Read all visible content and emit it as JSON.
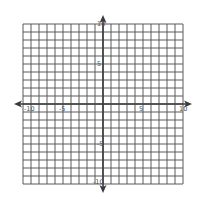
{
  "chart_data": {
    "type": "coordinate-grid",
    "title": "",
    "xlabel": "",
    "ylabel": "",
    "xlim": [
      -10,
      10
    ],
    "ylim": [
      -10,
      10
    ],
    "grid": true,
    "grid_step": 1,
    "x_tick_labels": [
      "-10",
      "-5",
      "5",
      "10"
    ],
    "y_tick_labels": [
      "10",
      "5",
      "-5",
      "-10"
    ],
    "x_tick_values": [
      -10,
      -5,
      5,
      10
    ],
    "y_tick_values": [
      10,
      5,
      -5,
      -10
    ],
    "axis_arrows": true,
    "series": []
  },
  "colors": {
    "grid_line": "#5a5a5a",
    "axis_line": "#3a3a3a",
    "label": "#555555",
    "background": "#ffffff"
  },
  "layout": {
    "origin_px": [
      103,
      104
    ],
    "unit_px": 8
  }
}
